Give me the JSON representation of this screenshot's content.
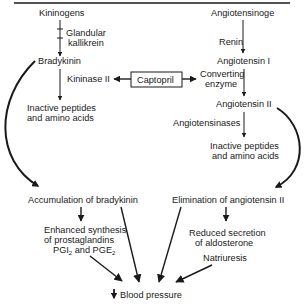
{
  "diagram": {
    "left_pathway": {
      "precursor": "Kininogens",
      "enzyme": [
        "Glandular",
        "kallikrein"
      ],
      "product": "Bradykinin",
      "degrading_enzyme": "Kininase II",
      "degradation_products": [
        "Inactive peptides",
        "and amino acids"
      ]
    },
    "right_pathway": {
      "precursor": "Angiotensinoge",
      "enzyme": "Renin",
      "intermediate": "Angiotensin I",
      "converting_enzyme": [
        "Converting",
        "enzyme"
      ],
      "product": "Angiotensin II",
      "degrading_enzyme": "Angiotensinases",
      "degradation_products": [
        "Inactive peptides",
        "and amino acids"
      ]
    },
    "inhibitor": "Captopril",
    "effects": {
      "left": "Accumulation of bradykinin",
      "left_sub": [
        "Enhanced synthesis",
        "of prostaglandins",
        "PGI",
        "2",
        " and PGE",
        "2"
      ],
      "right": "Elimination of angiotensin II",
      "right_sub": [
        "Reduced secretion",
        "of aldosterone"
      ],
      "right_sub2": "Natriuresis"
    },
    "outcome": {
      "symbol": "↓",
      "label": "Blood pressure"
    }
  }
}
